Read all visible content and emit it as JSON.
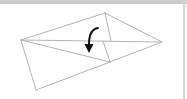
{
  "diagram": {
    "type": "origami-fold-step",
    "line_color": "#b3b3b3",
    "arrow_color": "#111111",
    "frame": {
      "top_bar_color": "#cbcbcb",
      "right_strip_color": "#d4d4d4"
    },
    "vertices": {
      "left": [
        21,
        40
      ],
      "top": [
        105,
        13
      ],
      "right": [
        162,
        42
      ],
      "bottom_left": [
        36,
        90
      ],
      "lower_mid": [
        110,
        62
      ],
      "center_top": [
        111,
        41
      ],
      "center_low": [
        103,
        41
      ]
    },
    "fold_arrow": {
      "direction": "down",
      "meaning": "fold-down"
    }
  }
}
